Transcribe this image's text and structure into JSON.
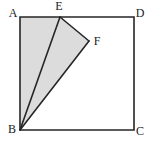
{
  "figure": {
    "background_color": "#ffffff",
    "stroke_color": "#262626",
    "shade_color": "#dcdcdc",
    "label_color": "#1a1a1a",
    "stroke_width": 1.6,
    "points": {
      "A": {
        "label": "A",
        "x": 20,
        "y": 17,
        "label_x": 13,
        "label_y": 14
      },
      "B": {
        "label": "B",
        "x": 20,
        "y": 130,
        "label_x": 12,
        "label_y": 130
      },
      "C": {
        "label": "C",
        "x": 134,
        "y": 130,
        "label_x": 140,
        "label_y": 132
      },
      "D": {
        "label": "D",
        "x": 134,
        "y": 17,
        "label_x": 140,
        "label_y": 14
      },
      "E": {
        "label": "E",
        "x": 60,
        "y": 17,
        "label_x": 59,
        "label_y": 7
      },
      "F": {
        "label": "F",
        "x": 89,
        "y": 41,
        "label_x": 97,
        "label_y": 42
      }
    },
    "square_path": "M 20 17 L 134 17 L 134 130 L 20 130 Z",
    "shaded_path": "M 20 17 L 60 17 L 89 41 L 20 130 Z",
    "segment_BE": "M 20 130 L 60 17",
    "segment_BF": "M 20 130 L 89 41",
    "segment_EF": "M 60 17 L 89 41"
  }
}
